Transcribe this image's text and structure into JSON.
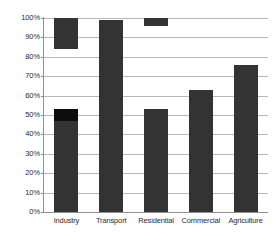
{
  "chart_data": {
    "type": "bar",
    "title": "",
    "subtitle": "",
    "xlabel": "",
    "ylabel": "",
    "categories": [
      "Industry",
      "Transport",
      "Residential",
      "Commercial",
      "Agriculture"
    ],
    "ylim": [
      0,
      100
    ],
    "y_tick_labels": [
      "100%",
      "90%",
      "80%",
      "70%",
      "60%",
      "50%",
      "40%",
      "30%",
      "20%",
      "10%",
      "0%"
    ],
    "y_tick_values": [
      100,
      90,
      80,
      70,
      60,
      50,
      40,
      30,
      20,
      10,
      0
    ],
    "grid": true,
    "legend": "none",
    "value_unit": "%",
    "series": [
      {
        "name": "Range",
        "values": [
          53,
          99,
          53,
          63,
          76
        ]
      }
    ],
    "bars": [
      {
        "category": "Industry",
        "segments": [
          {
            "name": "upper-floating-segment",
            "from": 84,
            "to": 100,
            "color": "#333333"
          },
          {
            "name": "main-segment",
            "from": 0,
            "to": 47,
            "color": "#333333"
          },
          {
            "name": "main-cap-segment",
            "from": 47,
            "to": 53,
            "color": "#0d0d0d"
          }
        ]
      },
      {
        "category": "Transport",
        "segments": [
          {
            "name": "main-segment",
            "from": 0,
            "to": 99,
            "color": "#333333"
          }
        ]
      },
      {
        "category": "Residential",
        "segments": [
          {
            "name": "upper-floating-segment",
            "from": 96,
            "to": 100,
            "color": "#333333"
          },
          {
            "name": "main-segment",
            "from": 0,
            "to": 53,
            "color": "#333333"
          }
        ]
      },
      {
        "category": "Commercial",
        "segments": [
          {
            "name": "main-segment",
            "from": 0,
            "to": 63,
            "color": "#333333"
          }
        ]
      },
      {
        "category": "Agriculture",
        "segments": [
          {
            "name": "main-segment",
            "from": 0,
            "to": 76,
            "color": "#333333"
          }
        ]
      }
    ],
    "colors": {
      "bar": "#333333",
      "bar_dark": "#0d0d0d",
      "gridline": "#b9b9b9",
      "axis": "#8f8f8f",
      "background": "#ffffff",
      "text": "#2b2b2b"
    }
  }
}
